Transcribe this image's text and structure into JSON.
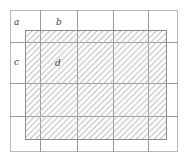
{
  "figure": {
    "type": "geometric-diagram",
    "width": 188,
    "height": 162,
    "background_color": "#ffffff"
  },
  "outer_frame": {
    "name": "outer-rectangle",
    "x": 10,
    "y": 10,
    "width": 168,
    "height": 142,
    "stroke_color": "#b8b8b8"
  },
  "grid": {
    "stroke_color": "#9a9a9a",
    "columns": 5,
    "rows": 4,
    "vertical_lines_x": [
      40,
      77,
      113,
      148
    ],
    "horizontal_lines_y": [
      42,
      83,
      116
    ]
  },
  "hatched_region": {
    "name": "hatched-rectangle",
    "x": 25,
    "y": 30,
    "width": 142,
    "height": 110,
    "stroke_color": "#8a8a8a",
    "hatch_color": "#bcbcbc",
    "hatch_angle_deg": 45,
    "hatch_spacing_px": 6,
    "hatch_direction": "bottom-left to top-right"
  },
  "labels": [
    {
      "id": "a",
      "text": "a",
      "x": 14,
      "y": 18,
      "style": "italic-serif"
    },
    {
      "id": "b",
      "text": "b",
      "x": 56,
      "y": 18,
      "style": "italic-serif"
    },
    {
      "id": "c",
      "text": "c",
      "x": 14,
      "y": 58,
      "style": "italic-serif"
    },
    {
      "id": "d",
      "text": "d",
      "x": 55,
      "y": 59,
      "style": "italic-serif"
    }
  ]
}
